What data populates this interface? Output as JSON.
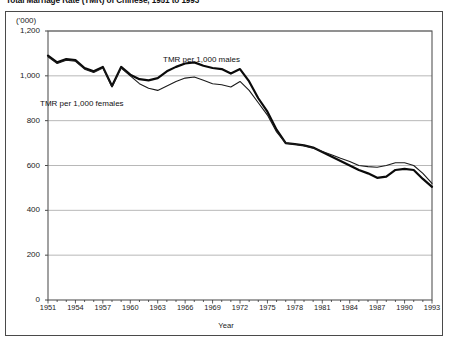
{
  "figure": {
    "title": "Total Marriage Rate (TMR) of Chinese, 1951 to 1993",
    "unit_label": "('000)",
    "xaxis_title": "Year"
  },
  "chart_data": {
    "type": "line",
    "title": "Total Marriage Rate (TMR) of Chinese, 1951 to 1993",
    "xlabel": "Year",
    "ylabel": "('000)",
    "xlim": [
      1951,
      1993
    ],
    "ylim": [
      0,
      1200
    ],
    "grid": true,
    "legend": "inline-annotation",
    "yticks": [
      "0",
      "200",
      "400",
      "600",
      "800",
      "1,000",
      "1,200"
    ],
    "ytick_values": [
      0,
      200,
      400,
      600,
      800,
      1000,
      1200
    ],
    "xticks": [
      "1951",
      "1954",
      "1957",
      "1960",
      "1963",
      "1966",
      "1969",
      "1972",
      "1975",
      "1978",
      "1981",
      "1984",
      "1987",
      "1990",
      "1993"
    ],
    "xtick_values": [
      1951,
      1954,
      1957,
      1960,
      1963,
      1966,
      1969,
      1972,
      1975,
      1978,
      1981,
      1984,
      1987,
      1990,
      1993
    ],
    "x": [
      1951,
      1952,
      1953,
      1954,
      1955,
      1956,
      1957,
      1958,
      1959,
      1960,
      1961,
      1962,
      1963,
      1964,
      1965,
      1966,
      1967,
      1968,
      1969,
      1970,
      1971,
      1972,
      1973,
      1974,
      1975,
      1976,
      1977,
      1978,
      1979,
      1980,
      1981,
      1982,
      1983,
      1984,
      1985,
      1986,
      1987,
      1988,
      1989,
      1990,
      1991,
      1992,
      1993
    ],
    "series": [
      {
        "name": "TMR per 1,000 males",
        "color": "#0a0a0a",
        "linewidth": 2.2,
        "values": [
          1090,
          1060,
          1075,
          1070,
          1035,
          1020,
          1040,
          955,
          1040,
          1005,
          985,
          980,
          990,
          1020,
          1040,
          1055,
          1060,
          1045,
          1035,
          1030,
          1010,
          1030,
          975,
          900,
          840,
          760,
          700,
          695,
          690,
          680,
          660,
          640,
          620,
          600,
          580,
          565,
          545,
          550,
          580,
          585,
          580,
          540,
          505
        ]
      },
      {
        "name": "TMR per 1,000 females",
        "color": "#1a1a1a",
        "linewidth": 1.1,
        "values": [
          1085,
          1055,
          1070,
          1065,
          1030,
          1015,
          1035,
          950,
          1035,
          1000,
          965,
          945,
          935,
          955,
          975,
          990,
          995,
          980,
          965,
          960,
          950,
          975,
          935,
          880,
          825,
          750,
          700,
          695,
          688,
          678,
          662,
          648,
          632,
          618,
          600,
          595,
          592,
          600,
          612,
          612,
          600,
          565,
          520
        ]
      }
    ],
    "annotations": [
      {
        "text": "TMR per 1,000 males",
        "x": 1964,
        "y": 1140
      },
      {
        "text": "TMR per 1,000 females",
        "x": 1952,
        "y": 905
      }
    ]
  }
}
